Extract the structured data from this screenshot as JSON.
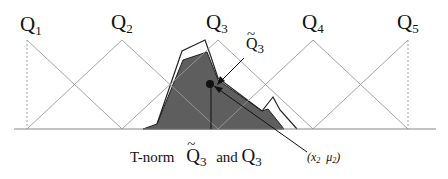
{
  "diagram": {
    "type": "fuzzy-membership-functions",
    "colors": {
      "membership_lines": "#9a9a9a",
      "shaded_region": "#5e5e5e",
      "outline": "#222222",
      "text": "#111111"
    },
    "labels": {
      "q1": "Q",
      "q1_sub": "1",
      "q2": "Q",
      "q2_sub": "2",
      "q3": "Q",
      "q3_sub": "3",
      "q4": "Q",
      "q4_sub": "4",
      "q5": "Q",
      "q5_sub": "5",
      "q3_tilde": "Q",
      "q3_tilde_sub": "3",
      "tnorm_prefix": "T-norm",
      "tnorm_q3_tilde": "Q",
      "tnorm_q3_tilde_sub": "3",
      "tnorm_and": "and",
      "tnorm_q3": "Q",
      "tnorm_q3_sub": "3",
      "point_x": "x",
      "point_x_sub": "2",
      "point_mu": "μ",
      "point_mu_sub": "2"
    },
    "membership_functions": [
      "Q1",
      "Q2",
      "Q3",
      "Q4",
      "Q5"
    ],
    "annotation": "T-norm of Q̃3 and Q3",
    "point": "(x2, μ2)"
  }
}
